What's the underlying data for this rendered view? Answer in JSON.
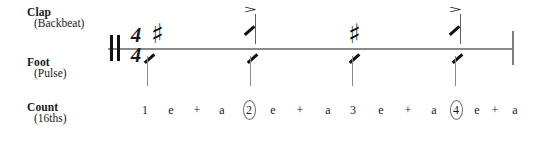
{
  "diagram": {
    "time_signature": {
      "numerator": "4",
      "denominator": "4"
    },
    "staff": {
      "start_barline": "double-barline",
      "end_barline": "single-barline"
    }
  },
  "rows": [
    {
      "name": "clap",
      "label_main": "Clap",
      "label_sub": "(Backbeat)"
    },
    {
      "name": "foot",
      "label_main": "Foot",
      "label_sub": "(Pulse)"
    },
    {
      "name": "count",
      "label_main": "Count",
      "label_sub": "(16ths)"
    }
  ],
  "clap_events": [
    {
      "beat": 1,
      "symbol": "eighth-rest",
      "glyph": "♯",
      "accent": "",
      "x": 143
    },
    {
      "beat": 2,
      "symbol": "slash-note",
      "glyph": "",
      "accent": ">",
      "x": 239
    },
    {
      "beat": 3,
      "symbol": "eighth-rest",
      "glyph": "♯",
      "accent": "",
      "x": 340
    },
    {
      "beat": 4,
      "symbol": "slash-note",
      "glyph": "",
      "accent": ">",
      "x": 444
    }
  ],
  "foot_events": [
    {
      "beat": 1,
      "symbol": "slash-note",
      "x": 140
    },
    {
      "beat": 2,
      "symbol": "slash-note",
      "x": 243
    },
    {
      "beat": 3,
      "symbol": "slash-note",
      "x": 345
    },
    {
      "beat": 4,
      "symbol": "slash-note",
      "x": 448
    }
  ],
  "count_row": [
    {
      "text": "1",
      "circled": false,
      "x": 137
    },
    {
      "text": "e",
      "circled": false,
      "x": 163
    },
    {
      "text": "+",
      "circled": false,
      "x": 189
    },
    {
      "text": "a",
      "circled": false,
      "x": 214
    },
    {
      "text": "2",
      "circled": true,
      "x": 241
    },
    {
      "text": "e",
      "circled": false,
      "x": 265
    },
    {
      "text": "+",
      "circled": false,
      "x": 292
    },
    {
      "text": "a",
      "circled": false,
      "x": 320
    },
    {
      "text": "3",
      "circled": false,
      "x": 345
    },
    {
      "text": "e",
      "circled": false,
      "x": 373
    },
    {
      "text": "+",
      "circled": false,
      "x": 400
    },
    {
      "text": "a",
      "circled": false,
      "x": 426
    },
    {
      "text": "4",
      "circled": true,
      "x": 448
    },
    {
      "text": "e",
      "circled": false,
      "x": 469
    },
    {
      "text": "+",
      "circled": false,
      "x": 487
    },
    {
      "text": "a",
      "circled": false,
      "x": 507
    }
  ],
  "colors": {
    "ink": "#1a1a1a",
    "staff_line": "#8a8a8a",
    "stem": "#5f5f5f",
    "circle": "#6e6e6e"
  }
}
